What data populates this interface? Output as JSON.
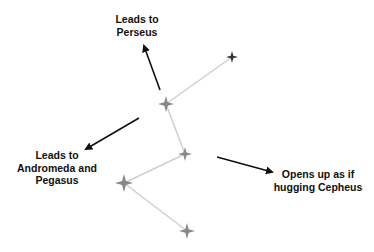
{
  "diagram": {
    "colors": {
      "star": "#888888",
      "star_dark": "#333333",
      "line": "#c8c8c8",
      "arrow": "#111111",
      "text": "#111111"
    },
    "stars": [
      {
        "id": "star-1",
        "name": "top-right"
      },
      {
        "id": "star-2",
        "name": "upper-middle"
      },
      {
        "id": "star-3",
        "name": "middle"
      },
      {
        "id": "star-4",
        "name": "left"
      },
      {
        "id": "star-5",
        "name": "bottom"
      }
    ],
    "annotations": [
      {
        "id": "perseus",
        "lines": [
          "Leads to",
          "Perseus"
        ]
      },
      {
        "id": "andromeda",
        "lines": [
          "Leads to",
          "Andromeda and",
          "Pegasus"
        ]
      },
      {
        "id": "cepheus",
        "lines": [
          "Opens up as if",
          "hugging Cepheus"
        ]
      }
    ]
  }
}
